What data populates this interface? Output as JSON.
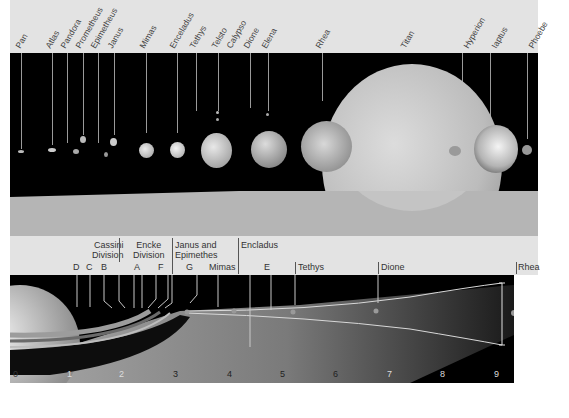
{
  "top_panel": {
    "moon_labels": [
      {
        "name": "Pan",
        "x": 21
      },
      {
        "name": "Atlas",
        "x": 52
      },
      {
        "name": "Pandora",
        "x": 67
      },
      {
        "name": "Prometheus",
        "x": 83
      },
      {
        "name": "Epimetheus",
        "x": 98
      },
      {
        "name": "Janus",
        "x": 114
      },
      {
        "name": "Mimas",
        "x": 146
      },
      {
        "name": "Enceladus",
        "x": 177
      },
      {
        "name": "Tethys",
        "x": 196
      },
      {
        "name": "Telsto",
        "x": 218
      },
      {
        "name": "Calypso",
        "x": 234
      },
      {
        "name": "Dione",
        "x": 250
      },
      {
        "name": "Elena",
        "x": 268
      },
      {
        "name": "Rhea",
        "x": 322
      },
      {
        "name": "Titan",
        "x": 407
      },
      {
        "name": "Hyperion",
        "x": 470
      },
      {
        "name": "Iaptus",
        "x": 498
      },
      {
        "name": "Phoebe",
        "x": 535
      }
    ]
  },
  "bottom_panel": {
    "labels": [
      {
        "text": "D",
        "x": 77,
        "y": 262
      },
      {
        "text": "C",
        "x": 90,
        "y": 262
      },
      {
        "text": "B",
        "x": 104,
        "y": 262
      },
      {
        "text": "Cassini\nDivision",
        "x": 92,
        "y": 238
      },
      {
        "text": "Encke\nDivision",
        "x": 132,
        "y": 238
      },
      {
        "text": "A",
        "x": 134,
        "y": 262
      },
      {
        "text": "F",
        "x": 158,
        "y": 262
      },
      {
        "text": "Janus and\nEpimethes",
        "x": 174,
        "y": 238
      },
      {
        "text": "G",
        "x": 186,
        "y": 262
      },
      {
        "text": "Mimas",
        "x": 208,
        "y": 262
      },
      {
        "text": "Encladus",
        "x": 240,
        "y": 238
      },
      {
        "text": "E",
        "x": 264,
        "y": 262
      },
      {
        "text": "Tethys",
        "x": 297,
        "y": 262
      },
      {
        "text": "Dione",
        "x": 381,
        "y": 262
      },
      {
        "text": "Rhea",
        "x": 519,
        "y": 262
      }
    ],
    "scale_ticks": [
      "0",
      "1",
      "2",
      "3",
      "4",
      "5",
      "6",
      "7",
      "8",
      "9"
    ]
  }
}
